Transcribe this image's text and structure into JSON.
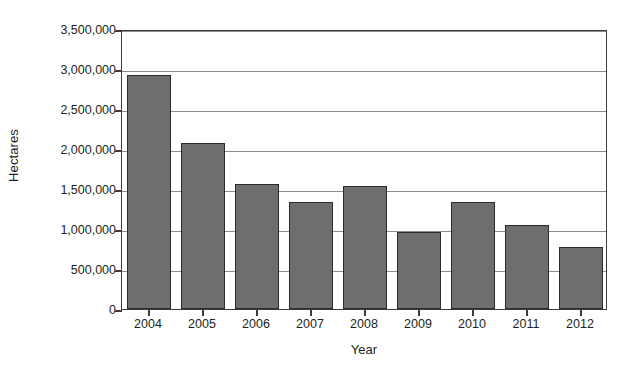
{
  "chart_data": {
    "type": "bar",
    "title": "",
    "subtitle": "",
    "xlabel": "Year",
    "ylabel": "Hectares",
    "categories": [
      "2004",
      "2005",
      "2006",
      "2007",
      "2008",
      "2009",
      "2010",
      "2011",
      "2012"
    ],
    "values": [
      2920000,
      2080000,
      1560000,
      1335000,
      1535000,
      960000,
      1340000,
      1055000,
      775000
    ],
    "series": [
      {
        "name": "Hectares",
        "values": [
          2920000,
          2080000,
          1560000,
          1335000,
          1535000,
          960000,
          1340000,
          1055000,
          775000
        ]
      }
    ],
    "ylim": [
      0,
      3500000
    ],
    "ytick_values": [
      0,
      500000,
      1000000,
      1500000,
      2000000,
      2500000,
      3000000,
      3500000
    ],
    "ytick_labels": [
      "0",
      "500,000",
      "1,000,000",
      "1,500,000",
      "2,000,000",
      "2,500,000",
      "3,000,000",
      "3,500,000"
    ],
    "grid": "horizontal",
    "legend": "none",
    "bar_color": "#6e6e6e",
    "bar_border_color": "#2b2b2b",
    "gridline_color": "#8c8c8c",
    "axis_color": "#3c3c3c",
    "background_color": "#ffffff",
    "text_color": "#231f20",
    "annotations": []
  }
}
